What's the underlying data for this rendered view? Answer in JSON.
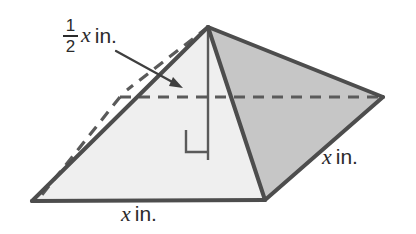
{
  "figure": {
    "name": "square-pyramid-diagram",
    "shape": "square pyramid",
    "colors": {
      "outline": "#4d4d4d",
      "left_face_fill": "#efefef",
      "right_face_fill": "#c6c6c6",
      "front_face_fill": "#f2f2f2",
      "label_text": "#2b2b2b",
      "background": "#ffffff"
    },
    "labels": {
      "height": {
        "numerator": "1",
        "denominator": "2",
        "variable": "x",
        "unit": "in."
      },
      "base_edge": {
        "variable": "x",
        "unit": "in."
      },
      "side_edge": {
        "variable": "x",
        "unit": "in."
      }
    },
    "geometry": {
      "apex": [
        208,
        27
      ],
      "left_vertex": [
        32,
        201
      ],
      "front_vertex": [
        265,
        200
      ],
      "right_vertex": [
        383,
        97
      ],
      "hidden_back_vertex": [
        120,
        97
      ],
      "height_foot": [
        208,
        160
      ],
      "hidden_edges": "dashed",
      "right_angle_marker": true
    },
    "annotations": {
      "arrow": {
        "from": [
          118,
          52
        ],
        "to": [
          180,
          86
        ],
        "points_to": "height-line"
      }
    }
  }
}
